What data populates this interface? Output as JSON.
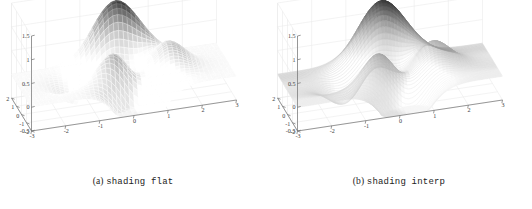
{
  "figure": {
    "background": "#ffffff",
    "panel_count": 2
  },
  "panels": [
    {
      "id": "panel-a",
      "caption_label": "(a)",
      "caption_code": "shading flat",
      "shading_mode": "flat",
      "mesh_edge_color": "#c8c8c8",
      "surface_dark": "#1a1a1a",
      "surface_light": "#fbfbfb"
    },
    {
      "id": "panel-b",
      "caption_label": "(b)",
      "caption_code": "shading interp",
      "shading_mode": "interp",
      "mesh_edge_color": "#b4b4b4",
      "surface_dark": "#141414",
      "surface_light": "#fdfdfd"
    }
  ],
  "chart_data": {
    "type": "surface",
    "title": "",
    "subtitle": "",
    "function": "peaks",
    "xlabel": "",
    "ylabel": "",
    "zlabel": "",
    "colormap": "gray",
    "grid": true,
    "legend": null,
    "view_azimuth": -37.5,
    "view_elevation": 30,
    "xlim": [
      -3,
      3
    ],
    "ylim": [
      -2,
      2
    ],
    "zlim": [
      -0.5,
      1.5
    ],
    "x_ticks": [
      -3,
      -2,
      -1,
      0,
      1,
      2,
      3
    ],
    "x_tick_labels": [
      "-3",
      "-2",
      "-1",
      "0",
      "1",
      "2",
      "3"
    ],
    "y_ticks": [
      -2,
      -1,
      0,
      1,
      2
    ],
    "y_tick_labels": [
      "-2",
      "-1",
      "0",
      "1",
      "2"
    ],
    "z_ticks": [
      -0.5,
      0,
      0.5,
      1,
      1.5
    ],
    "z_tick_labels": [
      "-0.5",
      "0",
      "0.5",
      "1",
      "1.5"
    ],
    "peak_value": 1.3,
    "trough_value": -0.45,
    "series": [
      {
        "name": "peaks surface",
        "description": "Gaussian bump near (x=-0.3, y=1.0) rising to z=1.3, secondary ridge near (x=1.3, y=-0.3) and a dark trough near (x=0.5, y=-1.4) dipping to z=-0.45"
      }
    ]
  }
}
